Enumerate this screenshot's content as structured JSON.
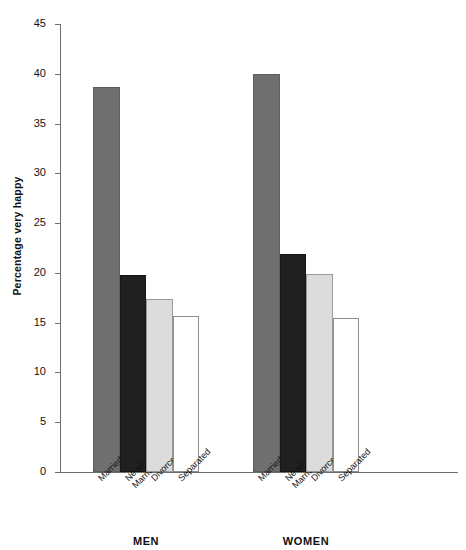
{
  "chart_data": {
    "type": "bar",
    "title": "",
    "subtitle": "",
    "xlabel": "",
    "ylabel": "Percentage very happy",
    "ylim": [
      0,
      45
    ],
    "ytick_step": 5,
    "yticks": [
      45,
      40,
      35,
      30,
      25,
      20,
      15,
      10,
      5,
      0
    ],
    "grid": false,
    "legend": "none",
    "categories": [
      "Married",
      "Never\nMarried",
      "Divorced",
      "Separated"
    ],
    "groups": [
      {
        "name": "MEN",
        "values": [
          38.7,
          19.8,
          17.4,
          15.7
        ],
        "bars": [
          {
            "category": "Married",
            "value": 38.7,
            "fill": "dark-gray"
          },
          {
            "category": "Never\nMarried",
            "value": 19.8,
            "fill": "black"
          },
          {
            "category": "Divorced",
            "value": 17.4,
            "fill": "light-gray"
          },
          {
            "category": "Separated",
            "value": 15.7,
            "fill": "white"
          }
        ]
      },
      {
        "name": "WOMEN",
        "values": [
          40.0,
          21.9,
          19.9,
          15.5
        ],
        "bars": [
          {
            "category": "Married",
            "value": 40.0,
            "fill": "dark-gray"
          },
          {
            "category": "Never\nMarried",
            "value": 21.9,
            "fill": "black"
          },
          {
            "category": "Divorced",
            "value": 19.9,
            "fill": "light-gray"
          },
          {
            "category": "Separated",
            "value": 15.5,
            "fill": "white"
          }
        ]
      }
    ],
    "colors": {
      "dark-gray": "#6f6f6f",
      "black": "#202020",
      "light-gray": "#dcdcdc",
      "white": "#ffffff",
      "axis": "#6d6d6d",
      "text": "#111111"
    }
  }
}
